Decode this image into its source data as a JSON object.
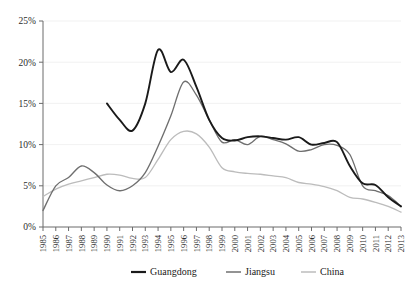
{
  "chart_data": {
    "type": "line",
    "title": "",
    "xlabel": "",
    "ylabel": "",
    "ylim": [
      0,
      25
    ],
    "ytick_labels": [
      "0%",
      "5%",
      "10%",
      "15%",
      "20%",
      "25%"
    ],
    "yticks": [
      0,
      5,
      10,
      15,
      20,
      25
    ],
    "grid": true,
    "legend_position": "bottom",
    "categories": [
      "1985",
      "1986",
      "1987",
      "1988",
      "1989",
      "1990",
      "1991",
      "1992",
      "1993",
      "1994",
      "1995",
      "1996",
      "1997",
      "1998",
      "1999",
      "2000",
      "2001",
      "2002",
      "2003",
      "2004",
      "2005",
      "2006",
      "2007",
      "2008",
      "2009",
      "2010",
      "2011",
      "2012",
      "2013"
    ],
    "series": [
      {
        "name": "Guangdong",
        "color": "#1a1a1a",
        "width": 1.9,
        "values": [
          null,
          null,
          null,
          null,
          null,
          15.0,
          13.0,
          11.7,
          15.0,
          21.5,
          18.8,
          20.3,
          17.0,
          13.0,
          10.8,
          10.5,
          10.9,
          11.0,
          10.8,
          10.6,
          10.9,
          10.0,
          10.2,
          10.3,
          7.4,
          5.3,
          5.1,
          3.6,
          2.5
        ]
      },
      {
        "name": "Jiangsu",
        "color": "#6f6f6f",
        "width": 1.35,
        "values": [
          2.0,
          5.0,
          6.0,
          7.4,
          6.6,
          5.1,
          4.4,
          5.0,
          6.6,
          9.8,
          13.5,
          17.6,
          16.0,
          13.0,
          10.3,
          10.6,
          10.0,
          11.0,
          10.6,
          10.1,
          9.2,
          9.4,
          10.0,
          9.9,
          8.8,
          5.0,
          4.4,
          3.8,
          2.5
        ]
      },
      {
        "name": "China",
        "color": "#bcbcbc",
        "width": 1.35,
        "values": [
          3.7,
          4.6,
          5.2,
          5.6,
          6.0,
          6.4,
          6.3,
          5.9,
          6.0,
          8.2,
          10.6,
          11.6,
          11.3,
          9.7,
          7.2,
          6.7,
          6.5,
          6.4,
          6.2,
          6.0,
          5.4,
          5.2,
          4.9,
          4.4,
          3.6,
          3.4,
          3.0,
          2.5,
          1.8
        ]
      }
    ],
    "legend": [
      {
        "label": "Guangdong",
        "color": "#1a1a1a",
        "width": 2.2
      },
      {
        "label": "Jiangsu",
        "color": "#6f6f6f",
        "width": 1.5
      },
      {
        "label": "China",
        "color": "#bcbcbc",
        "width": 1.5
      }
    ]
  }
}
